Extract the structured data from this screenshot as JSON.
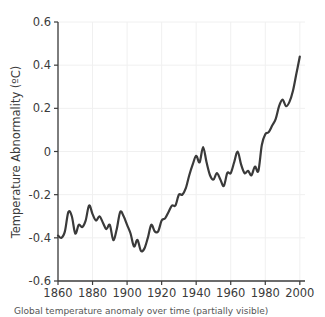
{
  "figure": {
    "background_color": "#ffffff",
    "plot_background_color": "#ffffff",
    "caption": "Global temperature anomaly over time (partially visible)"
  },
  "chart_data": {
    "type": "line",
    "title": "",
    "xlabel": "",
    "ylabel": "Temperature Abnormality (ºC)",
    "xlim": [
      1860,
      2003
    ],
    "ylim": [
      -0.6,
      0.6
    ],
    "grid": true,
    "grid_color": "#f0f0f0",
    "legend": "none",
    "line_color": "#3a3a3a",
    "line_width": 2.2,
    "xticks": [
      1860,
      1880,
      1900,
      1920,
      1940,
      1960,
      1980,
      2000
    ],
    "xtick_labels": [
      "1860",
      "1880",
      "1900",
      "1920",
      "1940",
      "1960",
      "1980",
      "2000"
    ],
    "yticks": [
      -0.6,
      -0.4,
      -0.2,
      0,
      0.2,
      0.4,
      0.6
    ],
    "ytick_labels": [
      "-0.6",
      "-0.4",
      "-0.2",
      "0",
      "0.2",
      "0.4",
      "0.6"
    ],
    "series": [
      {
        "name": "Temperature Abnormality",
        "x": [
          1860,
          1862,
          1864,
          1866,
          1868,
          1870,
          1872,
          1874,
          1876,
          1878,
          1880,
          1882,
          1884,
          1886,
          1888,
          1890,
          1892,
          1894,
          1896,
          1898,
          1900,
          1902,
          1904,
          1906,
          1908,
          1910,
          1912,
          1914,
          1916,
          1918,
          1920,
          1922,
          1924,
          1926,
          1928,
          1930,
          1932,
          1934,
          1936,
          1938,
          1940,
          1942,
          1944,
          1946,
          1948,
          1950,
          1952,
          1954,
          1956,
          1958,
          1960,
          1962,
          1964,
          1966,
          1968,
          1970,
          1972,
          1974,
          1976,
          1978,
          1980,
          1982,
          1984,
          1986,
          1988,
          1990,
          1992,
          1994,
          1996,
          1998,
          2000
        ],
        "values": [
          -0.39,
          -0.4,
          -0.37,
          -0.28,
          -0.3,
          -0.38,
          -0.34,
          -0.35,
          -0.32,
          -0.25,
          -0.29,
          -0.32,
          -0.3,
          -0.33,
          -0.36,
          -0.34,
          -0.41,
          -0.36,
          -0.28,
          -0.3,
          -0.34,
          -0.38,
          -0.44,
          -0.41,
          -0.46,
          -0.45,
          -0.4,
          -0.34,
          -0.37,
          -0.37,
          -0.32,
          -0.31,
          -0.28,
          -0.25,
          -0.25,
          -0.2,
          -0.2,
          -0.17,
          -0.11,
          -0.06,
          -0.02,
          -0.05,
          0.02,
          -0.05,
          -0.11,
          -0.13,
          -0.1,
          -0.13,
          -0.16,
          -0.1,
          -0.1,
          -0.05,
          0.0,
          -0.06,
          -0.1,
          -0.09,
          -0.11,
          -0.07,
          -0.09,
          0.03,
          0.08,
          0.09,
          0.12,
          0.15,
          0.21,
          0.24,
          0.21,
          0.23,
          0.28,
          0.36,
          0.44
        ]
      }
    ],
    "annotations": {
      "minimum": {
        "x": 1908,
        "y": -0.46
      },
      "mid_century_peak": {
        "x": 1944,
        "y": 0.02
      },
      "final_value": {
        "x": 2000,
        "y": 0.44
      }
    }
  }
}
